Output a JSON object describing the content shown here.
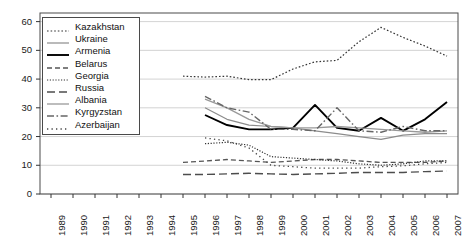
{
  "chart_data": {
    "type": "line",
    "title": "",
    "xlabel": "",
    "ylabel": "",
    "xlim": [
      1989,
      2007
    ],
    "ylim": [
      0,
      63
    ],
    "yticks": [
      0,
      10,
      20,
      30,
      40,
      50,
      60
    ],
    "grid": true,
    "legend_position": "top-left-inside",
    "x": [
      1989,
      1990,
      1991,
      1992,
      1993,
      1994,
      1995,
      1996,
      1997,
      1998,
      1999,
      2000,
      2001,
      2002,
      2003,
      2004,
      2005,
      2006,
      2007
    ],
    "series": [
      {
        "name": "Kazakhstan",
        "style": "dotted",
        "color": "#333333",
        "width": 1.2,
        "points": [
          [
            1995,
            41.0
          ],
          [
            1996,
            40.7
          ],
          [
            1997,
            41.0
          ],
          [
            1998,
            39.8
          ],
          [
            1999,
            39.8
          ],
          [
            2000,
            43.5
          ],
          [
            2001,
            46.0
          ],
          [
            2002,
            46.5
          ],
          [
            2003,
            53.0
          ],
          [
            2004,
            58.0
          ],
          [
            2005,
            54.5
          ],
          [
            2006,
            51.5
          ],
          [
            2007,
            48.0
          ],
          [
            2008,
            47.0
          ]
        ]
      },
      {
        "name": "Ukraine",
        "style": "solid",
        "color": "#8c8c8c",
        "width": 1.2,
        "points": [
          [
            1996,
            30.0
          ],
          [
            1997,
            26.0
          ],
          [
            1998,
            24.0
          ],
          [
            1999,
            23.5
          ],
          [
            2000,
            23.0
          ],
          [
            2001,
            22.0
          ],
          [
            2002,
            21.0
          ],
          [
            2003,
            20.0
          ],
          [
            2004,
            19.0
          ],
          [
            2005,
            20.5
          ],
          [
            2006,
            21.0
          ],
          [
            2007,
            21.0
          ]
        ]
      },
      {
        "name": "Armenia",
        "style": "solid",
        "color": "#000000",
        "width": 1.9,
        "points": [
          [
            1996,
            27.5
          ],
          [
            1997,
            24.0
          ],
          [
            1998,
            22.5
          ],
          [
            1999,
            22.5
          ],
          [
            2000,
            23.0
          ],
          [
            2001,
            31.0
          ],
          [
            2002,
            23.0
          ],
          [
            2003,
            22.0
          ],
          [
            2004,
            26.5
          ],
          [
            2005,
            22.0
          ],
          [
            2006,
            26.0
          ],
          [
            2007,
            32.0
          ]
        ]
      },
      {
        "name": "Belarus",
        "style": "dashed",
        "color": "#555555",
        "width": 1.3,
        "points": [
          [
            1995,
            11.0
          ],
          [
            1996,
            11.5
          ],
          [
            1997,
            12.0
          ],
          [
            1998,
            11.5
          ],
          [
            1999,
            11.0
          ],
          [
            2000,
            11.5
          ],
          [
            2001,
            12.0
          ],
          [
            2002,
            12.0
          ],
          [
            2003,
            11.5
          ],
          [
            2004,
            11.0
          ],
          [
            2005,
            11.0
          ],
          [
            2006,
            11.0
          ],
          [
            2007,
            11.5
          ]
        ]
      },
      {
        "name": "Georgia",
        "style": "fine-dotted",
        "color": "#333333",
        "width": 1.2,
        "points": [
          [
            1996,
            17.5
          ],
          [
            1997,
            18.0
          ],
          [
            1998,
            17.0
          ],
          [
            1999,
            13.0
          ],
          [
            2000,
            12.5
          ],
          [
            2001,
            12.0
          ],
          [
            2002,
            11.5
          ],
          [
            2003,
            10.5
          ],
          [
            2004,
            10.0
          ],
          [
            2005,
            10.5
          ],
          [
            2006,
            11.5
          ],
          [
            2007,
            11.5
          ]
        ]
      },
      {
        "name": "Russia",
        "style": "long-dashed",
        "color": "#4d4d4d",
        "width": 1.4,
        "points": [
          [
            1995,
            6.8
          ],
          [
            1996,
            6.8
          ],
          [
            1997,
            7.0
          ],
          [
            1998,
            7.2
          ],
          [
            1999,
            7.0
          ],
          [
            2000,
            6.8
          ],
          [
            2001,
            7.0
          ],
          [
            2002,
            7.2
          ],
          [
            2003,
            7.5
          ],
          [
            2004,
            7.5
          ],
          [
            2005,
            7.5
          ],
          [
            2006,
            7.8
          ],
          [
            2007,
            8.0
          ]
        ]
      },
      {
        "name": "Albania",
        "style": "solid",
        "color": "#999999",
        "width": 1.3,
        "points": [
          [
            1996,
            33.0
          ],
          [
            1997,
            30.0
          ],
          [
            1998,
            26.0
          ],
          [
            1999,
            23.5
          ],
          [
            2000,
            23.0
          ],
          [
            2001,
            23.0
          ],
          [
            2002,
            23.5
          ],
          [
            2003,
            23.0
          ],
          [
            2004,
            22.5
          ],
          [
            2005,
            22.0
          ],
          [
            2006,
            21.5
          ],
          [
            2007,
            22.0
          ]
        ]
      },
      {
        "name": "Kyrgyzstan",
        "style": "dash-dot",
        "color": "#666666",
        "width": 1.4,
        "points": [
          [
            1996,
            34.0
          ],
          [
            1997,
            30.0
          ],
          [
            1998,
            28.5
          ],
          [
            1999,
            22.5
          ],
          [
            2000,
            22.5
          ],
          [
            2001,
            22.0
          ],
          [
            2002,
            30.0
          ],
          [
            2003,
            22.0
          ],
          [
            2004,
            21.5
          ],
          [
            2005,
            23.5
          ],
          [
            2006,
            22.0
          ],
          [
            2007,
            22.0
          ]
        ]
      },
      {
        "name": "Azerbaijan",
        "style": "sparse-dotted",
        "color": "#444444",
        "width": 1.3,
        "points": [
          [
            1996,
            19.5
          ],
          [
            1997,
            18.5
          ],
          [
            1998,
            16.0
          ],
          [
            1999,
            10.0
          ],
          [
            2000,
            9.5
          ],
          [
            2001,
            9.0
          ],
          [
            2002,
            9.0
          ],
          [
            2003,
            9.0
          ],
          [
            2004,
            9.5
          ],
          [
            2005,
            9.8
          ],
          [
            2006,
            10.5
          ],
          [
            2007,
            11.0
          ]
        ]
      }
    ]
  },
  "axes": {
    "y_tick_labels": [
      "60",
      "50",
      "40",
      "30",
      "20",
      "10",
      "0"
    ],
    "x_tick_labels": [
      "1989",
      "1990",
      "1991",
      "1992",
      "1993",
      "1994",
      "1995",
      "1996",
      "1997",
      "1998",
      "1999",
      "2000",
      "2001",
      "2002",
      "2003",
      "2004",
      "2005",
      "2006",
      "2007"
    ]
  },
  "legend": {
    "items": [
      {
        "label": "Kazakhstan"
      },
      {
        "label": "Ukraine"
      },
      {
        "label": "Armenia"
      },
      {
        "label": "Belarus"
      },
      {
        "label": "Georgia"
      },
      {
        "label": "Russia"
      },
      {
        "label": "Albania"
      },
      {
        "label": "Kyrgyzstan"
      },
      {
        "label": "Azerbaijan"
      }
    ]
  }
}
